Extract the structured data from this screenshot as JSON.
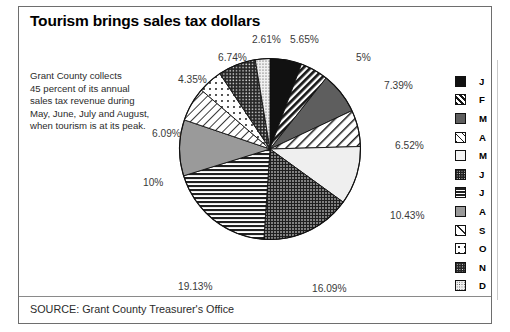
{
  "title": "Tourism brings sales tax dollars",
  "blurb": [
    "Grant County collects",
    "45 percent of its annual",
    "sales tax revenue during",
    "May, June, July and August,",
    "when tourism is at its peak."
  ],
  "source": "SOURCE: Grant County Treasurer's Office",
  "chart_data": {
    "type": "pie",
    "title": "Tourism brings sales tax dollars",
    "xlabel": "",
    "ylabel": "",
    "legend_position": "right",
    "grid": false,
    "start_angle_deg": 0,
    "direction": "clockwise",
    "categories": [
      "J",
      "F",
      "M",
      "A",
      "M",
      "J",
      "J",
      "A",
      "S",
      "O",
      "N",
      "D"
    ],
    "values": [
      5.65,
      5,
      7.39,
      6.52,
      10.43,
      16.09,
      19.13,
      10,
      6.09,
      4.35,
      6.74,
      2.61
    ],
    "value_labels": [
      "5.65%",
      "5%",
      "7.39%",
      "6.52%",
      "10.43%",
      "16.09%",
      "19.13%",
      "10%",
      "6.09%",
      "4.35%",
      "6.74%",
      "2.61%"
    ],
    "slices": [
      {
        "label": "J",
        "value": 5.65,
        "value_label": "5.65%",
        "pattern": "solid-black",
        "fill": "#111111"
      },
      {
        "label": "F",
        "value": 5,
        "value_label": "5%",
        "pattern": "diagonal-stripes",
        "fill": "#2b2b2b"
      },
      {
        "label": "M",
        "value": 7.39,
        "value_label": "7.39%",
        "pattern": "solid-dark-gray",
        "fill": "#5e5e5e"
      },
      {
        "label": "A",
        "value": 6.52,
        "value_label": "6.52%",
        "pattern": "wide-diagonal-hatch",
        "fill": "#f2f2f2"
      },
      {
        "label": "M",
        "value": 10.43,
        "value_label": "10.43%",
        "pattern": "near-white",
        "fill": "#efefef"
      },
      {
        "label": "J",
        "value": 16.09,
        "value_label": "16.09%",
        "pattern": "dense-dots",
        "fill": "#3a3a3a"
      },
      {
        "label": "J",
        "value": 19.13,
        "value_label": "19.13%",
        "pattern": "horizontal-lines",
        "fill": "#4a4a4a"
      },
      {
        "label": "A",
        "value": 10,
        "value_label": "10%",
        "pattern": "solid-medium-gray",
        "fill": "#9a9a9a"
      },
      {
        "label": "S",
        "value": 6.09,
        "value_label": "6.09%",
        "pattern": "thin-diagonal-lines",
        "fill": "#ffffff"
      },
      {
        "label": "O",
        "value": 4.35,
        "value_label": "4.35%",
        "pattern": "sparse-dots",
        "fill": "#ffffff"
      },
      {
        "label": "N",
        "value": 6.74,
        "value_label": "6.74%",
        "pattern": "dense-dark-dots",
        "fill": "#333333"
      },
      {
        "label": "D",
        "value": 2.61,
        "value_label": "2.61%",
        "pattern": "fine-light-dots",
        "fill": "#e4e4e4"
      }
    ]
  },
  "legend": {
    "items": [
      {
        "label": "J",
        "pattern": "solid-black"
      },
      {
        "label": "F",
        "pattern": "diagonal-stripes"
      },
      {
        "label": "M",
        "pattern": "solid-dark-gray"
      },
      {
        "label": "A",
        "pattern": "wide-diagonal-hatch"
      },
      {
        "label": "M",
        "pattern": "near-white"
      },
      {
        "label": "J",
        "pattern": "dense-dots"
      },
      {
        "label": "J",
        "pattern": "horizontal-lines"
      },
      {
        "label": "A",
        "pattern": "solid-medium-gray"
      },
      {
        "label": "S",
        "pattern": "thin-diagonal-lines"
      },
      {
        "label": "O",
        "pattern": "sparse-dots"
      },
      {
        "label": "N",
        "pattern": "dense-dark-dots"
      },
      {
        "label": "D",
        "pattern": "fine-light-dots"
      }
    ]
  },
  "label_positions": [
    {
      "value_label": "5.65%",
      "x": 290,
      "y": 34
    },
    {
      "value_label": "5%",
      "x": 356,
      "y": 52
    },
    {
      "value_label": "7.39%",
      "x": 384,
      "y": 80
    },
    {
      "value_label": "6.52%",
      "x": 395,
      "y": 140
    },
    {
      "value_label": "10.43%",
      "x": 390,
      "y": 210
    },
    {
      "value_label": "16.09%",
      "x": 312,
      "y": 283
    },
    {
      "value_label": "19.13%",
      "x": 178,
      "y": 281
    },
    {
      "value_label": "10%",
      "x": 143,
      "y": 177
    },
    {
      "value_label": "6.09%",
      "x": 152,
      "y": 128
    },
    {
      "value_label": "4.35%",
      "x": 178,
      "y": 74
    },
    {
      "value_label": "6.74%",
      "x": 218,
      "y": 52
    },
    {
      "value_label": "2.61%",
      "x": 252,
      "y": 34
    }
  ]
}
